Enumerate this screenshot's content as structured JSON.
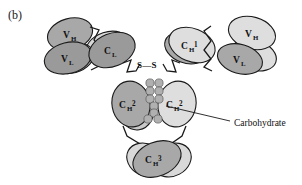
{
  "figure": {
    "panel_label": "(b)",
    "caption_labels": {
      "carbohydrate": "Carbohydrate",
      "disulfide": "S—S"
    },
    "domains": {
      "left_vh": {
        "base": "V",
        "sub": "H"
      },
      "left_vl": {
        "base": "V",
        "sub": "L"
      },
      "left_cl": {
        "base": "C",
        "sub": "L"
      },
      "left_ch1": {
        "base": "C",
        "sub": "H",
        "sup": "1"
      },
      "right_ch1": {
        "base": "C",
        "sub": "H",
        "sup": "1"
      },
      "right_vh": {
        "base": "V",
        "sub": "H"
      },
      "right_vl": {
        "base": "V",
        "sub": "L"
      },
      "left_ch2": {
        "base": "C",
        "sub": "H",
        "sup": "2"
      },
      "right_ch2": {
        "base": "C",
        "sub": "H",
        "sup": "2"
      },
      "ch3": {
        "base": "C",
        "sub": "H",
        "sup": "3"
      }
    },
    "colors": {
      "dark_gray": "#9a9a9a",
      "mid_gray": "#a8a8a8",
      "light_gray": "#d9d9d9",
      "bead_gray": "#b0b0b0",
      "outline": "#1a1a1a",
      "background": "#ffffff",
      "text": "#111111"
    },
    "legend_note": "Immunoglobulin G schematic: two heavy chains and two light chains with variable and constant domains, interchain disulfide bonds at the hinge, and a carbohydrate moiety between the CH2 domains."
  }
}
